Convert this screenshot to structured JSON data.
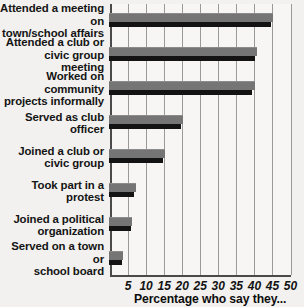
{
  "chart_data": {
    "type": "bar",
    "orientation": "horizontal",
    "title": "",
    "xlabel": "Percentage who say they...",
    "ylabel": "",
    "xlim": [
      0,
      52
    ],
    "xticks": [
      5,
      10,
      15,
      20,
      25,
      30,
      35,
      40,
      45,
      50
    ],
    "grid": true,
    "legend": "none",
    "categories": [
      "Attended a meeting on\ntown/school affairs",
      "Attended a club or\ncivic group meeting",
      "Worked on community\nprojects informally",
      "Served as club officer",
      "Joined a club or\ncivic group",
      "Took part in a protest",
      "Joined a political\norganization",
      "Served on a town or\nschool board"
    ],
    "series": [
      {
        "name": "upper-band",
        "color": "#767575",
        "values": [
          45.5,
          41,
          40.5,
          20.5,
          15.5,
          7.5,
          6.5,
          4
        ]
      },
      {
        "name": "lower-band",
        "color": "#131313",
        "values": [
          45,
          40.5,
          39.5,
          20,
          15,
          7,
          6,
          3.5
        ]
      }
    ]
  },
  "colors": {
    "background": "#f2f1ef",
    "plot_background": "#f7f6f4",
    "axis": "#4a4a4a",
    "gridline": "#9a9a98",
    "bar_upper": "#767575",
    "bar_lower": "#131313",
    "text": "#141414"
  }
}
